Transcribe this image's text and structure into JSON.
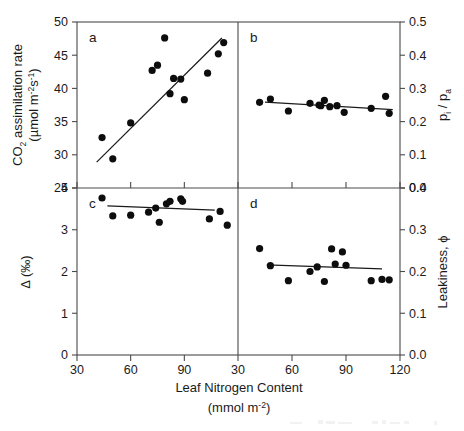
{
  "figure": {
    "width": 464,
    "height": 431,
    "background": "#ffffff",
    "point_color": "#0d0d0d",
    "line_color": "#1a1a1a",
    "axis_color": "#4a4a4a",
    "xlabel_line1": "Leaf Nitrogen Content",
    "xlabel_line2_pre": "(mmol m",
    "xlabel_line2_sup": "-2",
    "xlabel_line2_post": ")"
  },
  "chart_data": [
    {
      "type": "scatter",
      "panel": "a",
      "panel_label": "a",
      "title": "",
      "xlabel": "Leaf Nitrogen Content (mmol m-2)",
      "ylabel": "CO2 assimilation rate (umol m-2 s-1)",
      "xlim": [
        30,
        120
      ],
      "ylim": [
        25,
        50
      ],
      "xticks": [
        30,
        60,
        90
      ],
      "yticks": [
        25,
        30,
        35,
        40,
        45,
        50
      ],
      "grid": false,
      "legend": "none",
      "x": [
        44,
        50,
        60,
        72,
        75,
        79,
        82,
        84,
        88,
        90,
        103,
        109,
        112
      ],
      "y": [
        32.6,
        29.4,
        34.8,
        42.7,
        43.5,
        47.6,
        39.2,
        41.5,
        41.4,
        38.3,
        42.3,
        45.2,
        46.9
      ],
      "fitline": {
        "x": [
          41,
          111
        ],
        "y": [
          28.9,
          47.6
        ]
      }
    },
    {
      "type": "scatter",
      "panel": "b",
      "panel_label": "b",
      "title": "",
      "xlabel": "Leaf Nitrogen Content (mmol m-2)",
      "ylabel": "pi / pa",
      "xlim": [
        30,
        120
      ],
      "ylim": [
        0.0,
        0.5
      ],
      "xticks": [
        30,
        60,
        90,
        120
      ],
      "yticks": [
        0.0,
        0.1,
        0.2,
        0.3,
        0.4,
        0.5
      ],
      "grid": false,
      "legend": "none",
      "x": [
        42,
        48,
        58,
        70,
        75,
        76,
        78,
        81,
        85,
        89,
        104,
        112,
        114
      ],
      "y": [
        0.258,
        0.268,
        0.232,
        0.255,
        0.25,
        0.248,
        0.264,
        0.245,
        0.248,
        0.228,
        0.24,
        0.276,
        0.225
      ],
      "fitline": {
        "x": [
          45,
          116
        ],
        "y": [
          0.259,
          0.236
        ]
      }
    },
    {
      "type": "scatter",
      "panel": "c",
      "panel_label": "c",
      "title": "",
      "xlabel": "Leaf Nitrogen Content (mmol m-2)",
      "ylabel": "Delta (per mil)",
      "xlim": [
        30,
        120
      ],
      "ylim": [
        0,
        4
      ],
      "xticks": [
        30,
        60,
        90
      ],
      "yticks": [
        0,
        1,
        2,
        3,
        4
      ],
      "grid": false,
      "legend": "none",
      "x": [
        44,
        50,
        60,
        70,
        74,
        76,
        80,
        82,
        88,
        89,
        104,
        110,
        114
      ],
      "y": [
        3.76,
        3.33,
        3.35,
        3.42,
        3.52,
        3.18,
        3.62,
        3.68,
        3.74,
        3.68,
        3.26,
        3.44,
        3.11
      ],
      "fitline": {
        "x": [
          47,
          107
        ],
        "y": [
          3.57,
          3.47
        ]
      }
    },
    {
      "type": "scatter",
      "panel": "d",
      "panel_label": "d",
      "title": "",
      "xlabel": "Leaf Nitrogen Content (mmol m-2)",
      "ylabel": "Leakiness, phi",
      "xlim": [
        30,
        120
      ],
      "ylim": [
        0.0,
        0.4
      ],
      "xticks": [
        30,
        60,
        90,
        120
      ],
      "yticks": [
        0.0,
        0.1,
        0.2,
        0.3,
        0.4
      ],
      "grid": false,
      "legend": "none",
      "x": [
        42,
        48,
        58,
        70,
        74,
        78,
        82,
        84,
        88,
        90,
        104,
        110,
        114
      ],
      "y": [
        0.255,
        0.214,
        0.178,
        0.2,
        0.211,
        0.176,
        0.254,
        0.218,
        0.247,
        0.215,
        0.178,
        0.181,
        0.18
      ],
      "fitline": {
        "x": [
          46,
          110
        ],
        "y": [
          0.216,
          0.206
        ]
      }
    }
  ],
  "axes": {
    "panel_a": {
      "letter": "a",
      "ylabel_line1": "CO",
      "ylabel_line1_sub": "2",
      "ylabel_line1_rest": " assimilation rate",
      "ylabel_line2_pre": "(µmol m",
      "ylabel_line2_sup1": "-2",
      "ylabel_line2_mid": "s",
      "ylabel_line2_sup2": "-1",
      "ylabel_line2_post": ")",
      "tick_labels": [
        "50",
        "45",
        "40",
        "35",
        "30",
        "25"
      ]
    },
    "panel_b": {
      "letter": "b",
      "ylabel_pre": "p",
      "ylabel_sub1": "i",
      "ylabel_mid": " / p",
      "ylabel_sub2": "a",
      "tick_labels": [
        "0.5",
        "0.4",
        "0.3",
        "0.2",
        "0.1",
        "0.0"
      ]
    },
    "panel_c": {
      "letter": "c",
      "ylabel": "Δ (‰)",
      "tick_labels": [
        "4",
        "3",
        "2",
        "1",
        "0"
      ]
    },
    "panel_d": {
      "letter": "d",
      "ylabel_pre": "Leakiness, ",
      "ylabel_sym": "ϕ",
      "tick_labels": [
        "0.4",
        "0.3",
        "0.2",
        "0.1",
        "0.0"
      ]
    },
    "xaxis_left": {
      "tick_labels": [
        "30",
        "60",
        "90"
      ]
    },
    "xaxis_right": {
      "tick_labels": [
        "30",
        "60",
        "90",
        "120"
      ]
    }
  }
}
